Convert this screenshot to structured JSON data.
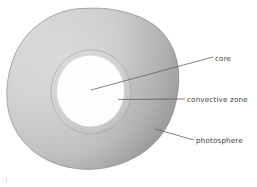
{
  "diagram": {
    "background_color": "#ffffff",
    "labels": [
      {
        "id": "core",
        "text": "core",
        "color": "#3d3d3d"
      },
      {
        "id": "convective_zone",
        "text": "convective zone",
        "color": "#3d3d3d"
      },
      {
        "id": "photosphere",
        "text": "photosphere",
        "color": "#3d3d3d"
      }
    ],
    "layers": [
      {
        "name": "photosphere",
        "shape": "irregular-circle",
        "fill_light": "#d2d2d2",
        "fill_dark": "#999999",
        "stroke": "#8f8f8f"
      },
      {
        "name": "convective zone",
        "shape": "ring",
        "fill_light": "#dadada",
        "fill_dark": "#bdbdbd",
        "stroke": "#a8a8a8"
      },
      {
        "name": "core",
        "shape": "circle",
        "fill": "#ffffff",
        "stroke": "#cccccc"
      }
    ],
    "leader_lines": [
      {
        "id": "core",
        "from_x": 91,
        "from_y": 90,
        "to_x": 213,
        "to_y": 57,
        "color": "#5a5a5a"
      },
      {
        "id": "convective_zone",
        "from_x": 118,
        "from_y": 99,
        "to_x": 185,
        "to_y": 99,
        "color": "#5a5a5a"
      },
      {
        "id": "photosphere",
        "from_x": 155,
        "from_y": 130,
        "to_x": 194,
        "to_y": 140,
        "color": "#5a5a5a"
      }
    ],
    "corner_mark": {
      "visible": true,
      "color": "#dcdcdc"
    }
  }
}
